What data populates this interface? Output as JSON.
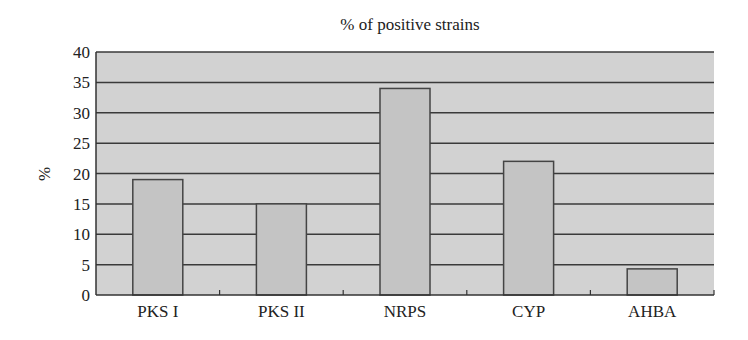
{
  "chart_data": {
    "type": "bar",
    "title": "% of positive strains",
    "xlabel": "",
    "ylabel": "%",
    "categories": [
      "PKS I",
      "PKS II",
      "NRPS",
      "CYP",
      "AHBA"
    ],
    "values": [
      19,
      15,
      34,
      22,
      4.3
    ],
    "ylim": [
      0,
      40
    ],
    "yticks": [
      0,
      5,
      10,
      15,
      20,
      25,
      30,
      35,
      40
    ],
    "grid": true,
    "legend": "none",
    "colors": {
      "plot_background": "#d2d2d2",
      "bar_fill": "#c4c4c4",
      "bar_stroke": "#444444",
      "gridline": "#3a3a3a"
    }
  }
}
